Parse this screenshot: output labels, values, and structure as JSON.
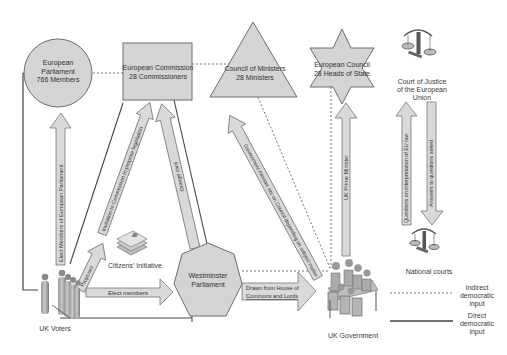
{
  "diagram": {
    "nodes": {
      "european_parliament": {
        "line1": "European",
        "line2": "Parliament",
        "line3": "766 Members"
      },
      "european_commission": {
        "line1": "European Commission",
        "line2": "28 Commissioners"
      },
      "council_of_ministers": {
        "line1": "Council of Ministers",
        "line2": "28 Ministers"
      },
      "european_council": {
        "line1": "European Council",
        "line2": "28 Heads of State"
      },
      "court_of_justice": {
        "line1": "Court of Justice",
        "line2": "of the European",
        "line3": "Union"
      },
      "westminster": {
        "line1": "Westminster",
        "line2": "Parliament"
      },
      "uk_voters": {
        "label": "UK Voters"
      },
      "uk_government": {
        "label": "UK Government"
      },
      "national_courts": {
        "label": "National courts"
      },
      "citizens_initiative": {
        "label": "Citizens' Initiative"
      }
    },
    "arrows": {
      "elect_meps": "Elect Members of European Parliament",
      "invitation": "Invitation to Commission to propose legislation",
      "proposes": "Proposes",
      "orange_card": "Orange card",
      "minister_sits": "Government minister sits on Council depending on subject matter",
      "uk_pm": "UK Prime Minister",
      "questions": "Questions on interpretation of EU law",
      "answers": "Answers to questions asked",
      "elect_members": "Elect members",
      "drawn_from": {
        "line1": "Drawn from House of",
        "line2": "Commons and Lords"
      }
    },
    "legend": {
      "indirect": {
        "line1": "Indirect",
        "line2": "democratic",
        "line3": "input"
      },
      "direct": {
        "line1": "Direct",
        "line2": "democratic",
        "line3": "input"
      }
    },
    "colors": {
      "shape_fill": "#d4d4d4",
      "shape_stroke": "#6e6e6e",
      "arrow_fill": "#d9d9d9",
      "line": "#444444",
      "dotted": "#777777"
    }
  }
}
